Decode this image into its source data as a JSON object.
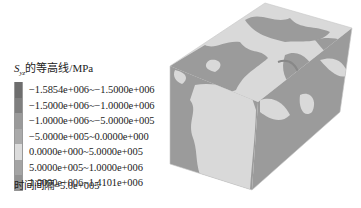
{
  "legend": {
    "title_symbol": "S",
    "title_subscript": "yz",
    "title_text": "的等高线/MPa",
    "items": [
      {
        "label": "−1.5854e+006~−1.5000e+006",
        "color": "#6e6e6e"
      },
      {
        "label": "−1.5000e+006~−1.0000e+006",
        "color": "#7f7f7f"
      },
      {
        "label": "−1.0000e+006~−5.0000e+005",
        "color": "#9a9a9a"
      },
      {
        "label": "−5.0000e+005~0.0000e+000",
        "color": "#aaaaaa"
      },
      {
        "label": "0.0000e+000~5.0000e+005",
        "color": "#dcdcdc"
      },
      {
        "label": "5.0000e+005~1.0000e+006",
        "color": "#a4a4a4"
      },
      {
        "label": "1.0000e+006~1.4101e+006",
        "color": "#939393"
      }
    ],
    "interval_label": "时间间隔=5.0e+005"
  },
  "model": {
    "light_color": "#d9d9d9",
    "dark_color": "#9b9b9b"
  }
}
